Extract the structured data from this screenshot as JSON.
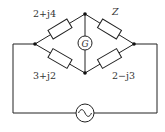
{
  "diagram": {
    "type": "AC bridge circuit",
    "impedances": {
      "top_left": "2+j4",
      "top_right": "Z",
      "bottom_left": "3+j2",
      "bottom_right": "2−j3"
    },
    "detector": {
      "label": "G"
    },
    "source": {
      "symbol": "~"
    }
  }
}
